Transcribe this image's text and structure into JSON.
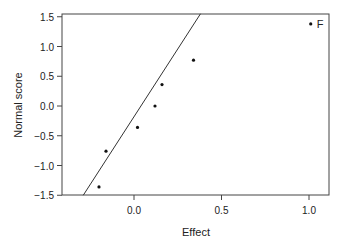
{
  "chart_data": {
    "type": "scatter",
    "title": "",
    "xlabel": "Effect",
    "ylabel": "Normal score",
    "xlim": [
      -0.4,
      1.12
    ],
    "ylim": [
      -1.55,
      1.58
    ],
    "x_ticks": [
      0.0,
      0.5,
      1.0
    ],
    "x_tick_labels": [
      "0.0",
      "0.5",
      "1.0"
    ],
    "y_ticks": [
      -1.5,
      -1.0,
      -0.5,
      0.0,
      0.5,
      1.0,
      1.5
    ],
    "y_tick_labels": [
      "-1.5",
      "-1.0",
      "-0.5",
      "0.0",
      "0.5",
      "1.0",
      "1.5"
    ],
    "grid": false,
    "points": [
      {
        "x": -0.2,
        "y": -1.36,
        "label": ""
      },
      {
        "x": -0.16,
        "y": -0.76,
        "label": ""
      },
      {
        "x": 0.02,
        "y": -0.36,
        "label": ""
      },
      {
        "x": 0.12,
        "y": 0.0,
        "label": ""
      },
      {
        "x": 0.16,
        "y": 0.36,
        "label": ""
      },
      {
        "x": 0.34,
        "y": 0.77,
        "label": ""
      },
      {
        "x": 1.01,
        "y": 1.38,
        "label": "F"
      }
    ],
    "reference_line": {
      "x1": -0.29,
      "y1": -1.5,
      "x2": 0.38,
      "y2": 1.55
    }
  }
}
